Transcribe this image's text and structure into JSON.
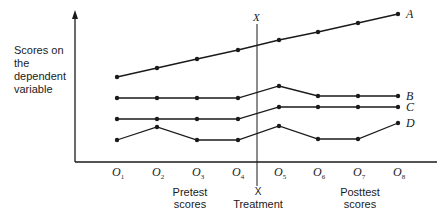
{
  "chart_data": {
    "type": "line",
    "title": "",
    "ylabel": "Scores on the dependent variable",
    "xlabel": "",
    "x": [
      "O1",
      "O2",
      "O3",
      "O4",
      "O5",
      "O6",
      "O7",
      "O8"
    ],
    "treatment_marker": {
      "label_top": "X",
      "label_bottom": "X",
      "caption": "Treatment",
      "between": [
        "O4",
        "O5"
      ]
    },
    "groups": [
      {
        "label": "Pretest scores",
        "range": [
          "O1",
          "O4"
        ]
      },
      {
        "label": "Posttest scores",
        "range": [
          "O5",
          "O8"
        ]
      }
    ],
    "series": [
      {
        "name": "A",
        "values": [
          1,
          2,
          3,
          4,
          5,
          6,
          7,
          8
        ]
      },
      {
        "name": "B",
        "values": [
          4.5,
          4.5,
          4.5,
          4.5,
          5.5,
          4.7,
          4.7,
          4.7
        ]
      },
      {
        "name": "C",
        "values": [
          3,
          3,
          3,
          3,
          3.9,
          3.9,
          3.9,
          3.9
        ]
      },
      {
        "name": "D",
        "values": [
          1.5,
          2.5,
          1.5,
          1.5,
          2.5,
          1.6,
          1.6,
          2.8
        ]
      }
    ],
    "grid": false,
    "legend": "inline labels at line ends"
  },
  "axis": {
    "ylabel_lines": [
      "Scores on",
      "the",
      "dependent",
      "variable"
    ],
    "ticks": [
      {
        "main": "O",
        "sub": "1"
      },
      {
        "main": "O",
        "sub": "2"
      },
      {
        "main": "O",
        "sub": "3"
      },
      {
        "main": "O",
        "sub": "4"
      },
      {
        "main": "O",
        "sub": "5"
      },
      {
        "main": "O",
        "sub": "6"
      },
      {
        "main": "O",
        "sub": "7"
      },
      {
        "main": "O",
        "sub": "8"
      }
    ]
  },
  "labels": {
    "series": [
      "A",
      "B",
      "C",
      "D"
    ],
    "x_top": "X",
    "x_bottom": "X",
    "treatment": "Treatment",
    "pretest": [
      "Pretest",
      "scores"
    ],
    "posttest": [
      "Posttest",
      "scores"
    ]
  }
}
